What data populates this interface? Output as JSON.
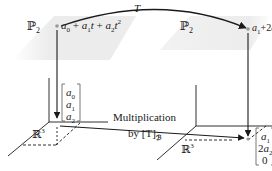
{
  "diagram": {
    "domain_space": {
      "label": "ℙ",
      "subscript": "2",
      "element": "a0 + a1t + a2t²"
    },
    "codomain_space": {
      "label": "ℙ",
      "subscript": "2",
      "element": "a1 + 2a2t"
    },
    "transformation": {
      "label": "T"
    },
    "coordinate_space_left": {
      "label": "ℝ",
      "superscript": "3",
      "vector": [
        "a0",
        "a1",
        "a2"
      ]
    },
    "coordinate_space_right": {
      "label": "ℝ",
      "superscript": "3",
      "vector": [
        "a1",
        "2a2",
        "0"
      ]
    },
    "matrix_map": {
      "line1": "Multiplication",
      "line2_prefix": "by [T]",
      "line2_subscript": "ℬ"
    }
  },
  "colors": {
    "plane_fill": "#ececec",
    "line": "#1a1a1a",
    "dot": "#9a9a9a"
  }
}
